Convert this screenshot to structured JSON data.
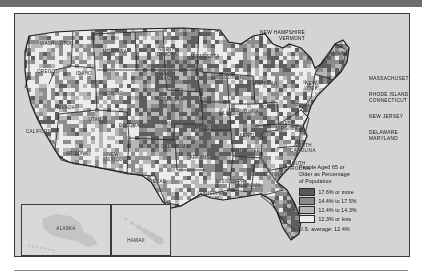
{
  "map": {
    "title": "People Aged 65 or Older as Percentage of Population",
    "ocean_color": "#d4d4d4",
    "border_color": "#3a3a3a",
    "state_labels": [
      {
        "name": "WASHINGTON",
        "x": 42,
        "y": 30
      },
      {
        "name": "OREGON",
        "x": 33,
        "y": 58
      },
      {
        "name": "IDAHO",
        "x": 69,
        "y": 60
      },
      {
        "name": "MONTANA",
        "x": 100,
        "y": 38
      },
      {
        "name": "NORTH\nDAKOTA",
        "x": 152,
        "y": 38
      },
      {
        "name": "SOUTH\nDAKOTA",
        "x": 152,
        "y": 62
      },
      {
        "name": "MINNESOTA",
        "x": 190,
        "y": 43
      },
      {
        "name": "WISCONSIN",
        "x": 214,
        "y": 64
      },
      {
        "name": "MICHIGAN",
        "x": 250,
        "y": 70
      },
      {
        "name": "WYOMING",
        "x": 96,
        "y": 80
      },
      {
        "name": "NEVADA",
        "x": 50,
        "y": 94
      },
      {
        "name": "UTAH",
        "x": 80,
        "y": 106
      },
      {
        "name": "COLORADO",
        "x": 118,
        "y": 112
      },
      {
        "name": "NEBRASKA",
        "x": 155,
        "y": 86
      },
      {
        "name": "IOWA",
        "x": 190,
        "y": 86
      },
      {
        "name": "KANSAS",
        "x": 157,
        "y": 110
      },
      {
        "name": "CALIFORNIA",
        "x": 26,
        "y": 118
      },
      {
        "name": "ARIZONA",
        "x": 62,
        "y": 140
      },
      {
        "name": "NEW\nMEXICO",
        "x": 98,
        "y": 143
      },
      {
        "name": "OKLAHOMA",
        "x": 160,
        "y": 133
      },
      {
        "name": "TEXAS",
        "x": 143,
        "y": 168
      },
      {
        "name": "MISSOURI",
        "x": 192,
        "y": 114
      },
      {
        "name": "ARKANSAS",
        "x": 188,
        "y": 144
      },
      {
        "name": "LOUISIANA",
        "x": 196,
        "y": 180
      },
      {
        "name": "MISSISSIPPI",
        "x": 216,
        "y": 168
      },
      {
        "name": "ALABAMA",
        "x": 234,
        "y": 172
      },
      {
        "name": "ILLINOIS",
        "x": 214,
        "y": 100
      },
      {
        "name": "INDIANA",
        "x": 234,
        "y": 98
      },
      {
        "name": "OHIO",
        "x": 254,
        "y": 94
      },
      {
        "name": "KENTUCKY",
        "x": 238,
        "y": 122
      },
      {
        "name": "TENNESSEE",
        "x": 230,
        "y": 137
      },
      {
        "name": "GEORGIA",
        "x": 256,
        "y": 161
      },
      {
        "name": "FLORIDA",
        "x": 280,
        "y": 196
      },
      {
        "name": "WEST\nVIRGINIA",
        "x": 272,
        "y": 112
      },
      {
        "name": "NORTH\nCAROLINA",
        "x": 288,
        "y": 134
      },
      {
        "name": "SOUTH\nCAROLINA",
        "x": 282,
        "y": 152
      },
      {
        "name": "NEW\nYORK",
        "x": 296,
        "y": 72
      },
      {
        "name": "PENN.",
        "x": 288,
        "y": 92
      },
      {
        "name": "MAINE",
        "x": 326,
        "y": 40
      },
      {
        "name": "VA.",
        "x": 290,
        "y": 120
      }
    ],
    "callouts": [
      {
        "name": "NEW HAMPSHIRE\nVERMONT",
        "x": 250,
        "y": 16,
        "align": "right"
      },
      {
        "name": "MASSACHUSETTS",
        "x": 354,
        "y": 62
      },
      {
        "name": "RHODE ISLAND\nCONNECTICUT",
        "x": 354,
        "y": 78
      },
      {
        "name": "NEW JERSEY",
        "x": 354,
        "y": 100
      },
      {
        "name": "DELAWARE\nMARYLAND",
        "x": 354,
        "y": 116
      }
    ],
    "insets": [
      {
        "name": "ALASKA",
        "x": 6,
        "y": 190,
        "w": 88,
        "h": 50,
        "lx": 50,
        "ly": 214
      },
      {
        "name": "HAWAII",
        "x": 96,
        "y": 190,
        "w": 58,
        "h": 50,
        "lx": 120,
        "ly": 226
      }
    ]
  },
  "legend": {
    "title": "People Aged 65 or\nOlder as Percentage\nof Population",
    "items": [
      {
        "label": "17.6% or more",
        "color": "#58585a"
      },
      {
        "label": "14.4% to 17.5%",
        "color": "#8a8a8c"
      },
      {
        "label": "12.4% to 14.3%",
        "color": "#b6b6b8"
      },
      {
        "label": "12.3% or less",
        "color": "#eeeeee"
      }
    ],
    "average": "U.S. average: 12.4%"
  },
  "chart_data": {
    "type": "heatmap",
    "title": "People Aged 65 or Older as Percentage of Population",
    "subtitle": "U.S. average: 12.4%",
    "legend_position": "bottom-right",
    "bins": [
      {
        "range": "17.6% or more",
        "min": 17.6,
        "max": null,
        "color": "#58585a"
      },
      {
        "range": "14.4% to 17.5%",
        "min": 14.4,
        "max": 17.5,
        "color": "#8a8a8c"
      },
      {
        "range": "12.4% to 14.3%",
        "min": 12.4,
        "max": 14.3,
        "color": "#b6b6b8"
      },
      {
        "range": "12.3% or less",
        "min": null,
        "max": 12.3,
        "color": "#eeeeee"
      }
    ],
    "unit": "percent",
    "national_average": 12.4
  }
}
